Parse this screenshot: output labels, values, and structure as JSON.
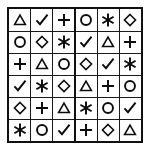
{
  "figure": {
    "rows": 6,
    "columns": 6,
    "border_color": "#111111",
    "gridline_color": "#1a1a1a",
    "background_color": "#ffffff",
    "symbol_color": "#0d0d0d"
  },
  "symbols": {
    "triangle": {
      "name": "triangle-icon",
      "char": "△"
    },
    "check": {
      "name": "check-icon",
      "char": "✓"
    },
    "plus": {
      "name": "plus-icon",
      "char": "＋"
    },
    "circle": {
      "name": "circle-icon",
      "char": "○"
    },
    "star": {
      "name": "six-pointed-asterisk-icon",
      "char": "✳"
    },
    "diamond": {
      "name": "diamond-icon",
      "char": "◇"
    }
  },
  "grid": [
    [
      "triangle",
      "check",
      "plus",
      "circle",
      "star",
      "diamond"
    ],
    [
      "circle",
      "diamond",
      "star",
      "check",
      "triangle",
      "plus"
    ],
    [
      "plus",
      "triangle",
      "circle",
      "diamond",
      "check",
      "star"
    ],
    [
      "check",
      "star",
      "diamond",
      "triangle",
      "plus",
      "circle"
    ],
    [
      "diamond",
      "plus",
      "triangle",
      "star",
      "circle",
      "check"
    ],
    [
      "star",
      "circle",
      "check",
      "plus",
      "diamond",
      "triangle"
    ]
  ]
}
